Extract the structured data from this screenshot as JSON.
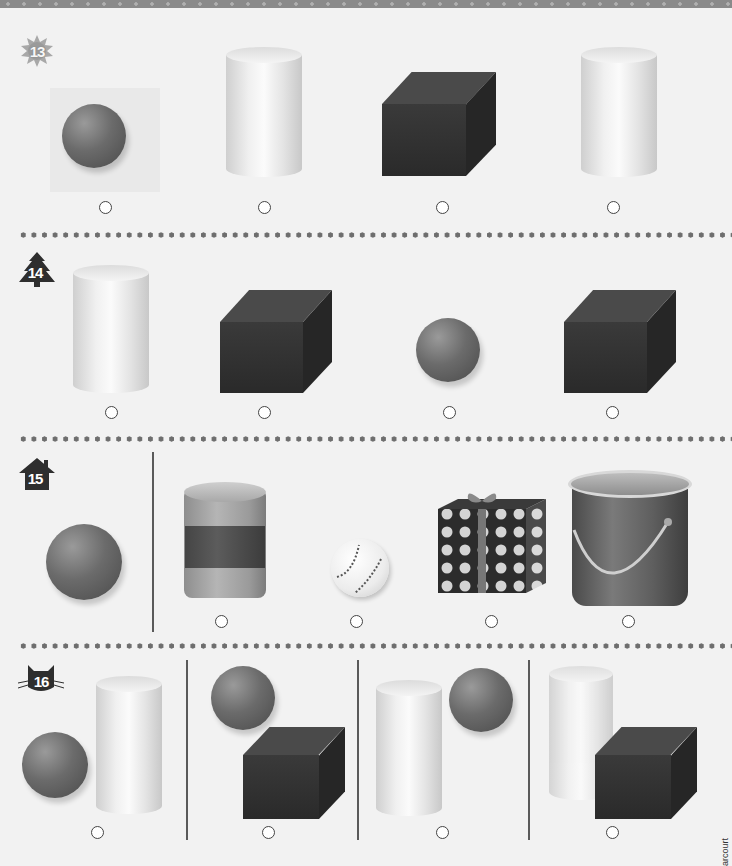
{
  "page": {
    "side_credit": "arcourt"
  },
  "problems": [
    {
      "number": "13",
      "badge_shape": "sun",
      "options": [
        {
          "label": "sphere",
          "answer_choice": ""
        },
        {
          "label": "cylinder",
          "answer_choice": ""
        },
        {
          "label": "cube",
          "answer_choice": ""
        },
        {
          "label": "cylinder",
          "answer_choice": ""
        }
      ]
    },
    {
      "number": "14",
      "badge_shape": "tree",
      "options": [
        {
          "label": "cylinder"
        },
        {
          "label": "cube"
        },
        {
          "label": "sphere"
        },
        {
          "label": "cube"
        }
      ]
    },
    {
      "number": "15",
      "badge_shape": "house",
      "prompt_shape": "sphere",
      "options": [
        {
          "label": "tin can"
        },
        {
          "label": "baseball"
        },
        {
          "label": "gift box"
        },
        {
          "label": "paint bucket"
        }
      ]
    },
    {
      "number": "16",
      "badge_shape": "cat",
      "prompt_shapes": [
        "sphere",
        "cylinder"
      ],
      "options": [
        {
          "label": "sphere and cube"
        },
        {
          "label": "cylinder and sphere"
        },
        {
          "label": "cylinder and cube"
        }
      ]
    }
  ]
}
